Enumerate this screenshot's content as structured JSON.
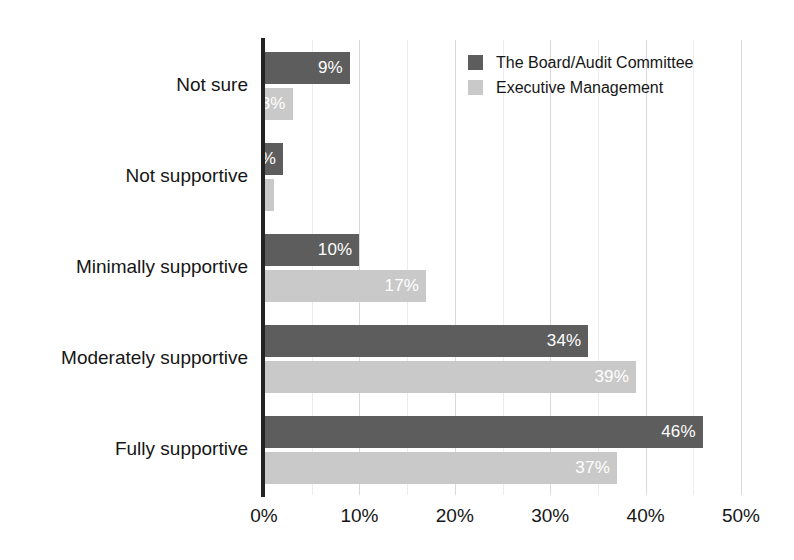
{
  "chart_data": {
    "type": "bar",
    "orientation": "horizontal",
    "title": "",
    "subtitle": "",
    "xlabel": "",
    "ylabel": "",
    "xlim": [
      0,
      50
    ],
    "xticks": [
      "0%",
      "10%",
      "20%",
      "30%",
      "40%",
      "50%"
    ],
    "xtick_values": [
      0,
      10,
      20,
      30,
      40,
      50
    ],
    "grid": true,
    "grid_minor_step": 5,
    "legend_position": "top-right",
    "categories": [
      "Not sure",
      "Not supportive",
      "Minimally supportive",
      "Moderately supportive",
      "Fully supportive"
    ],
    "series": [
      {
        "name": "The Board/Audit Committee",
        "color": "#5d5d5d",
        "values": [
          9,
          2,
          10,
          34,
          46
        ],
        "labels": [
          "9%",
          "2%",
          "10%",
          "34%",
          "46%"
        ]
      },
      {
        "name": "Executive Management",
        "color": "#c9c9c9",
        "values": [
          3,
          1,
          17,
          39,
          37
        ],
        "labels": [
          "3%",
          "",
          "17%",
          "39%",
          "37%"
        ]
      }
    ]
  },
  "legend": {
    "items": [
      {
        "label": "The Board/Audit Committee",
        "swatch": "#5d5d5d"
      },
      {
        "label": "Executive Management",
        "swatch": "#c9c9c9"
      }
    ]
  },
  "axis": {
    "x_ticks": [
      {
        "label": "0%",
        "value": 0
      },
      {
        "label": "10%",
        "value": 10
      },
      {
        "label": "20%",
        "value": 20
      },
      {
        "label": "30%",
        "value": 30
      },
      {
        "label": "40%",
        "value": 40
      },
      {
        "label": "50%",
        "value": 50
      }
    ],
    "y_categories": [
      "Not sure",
      "Not supportive",
      "Minimally supportive",
      "Moderately supportive",
      "Fully supportive"
    ]
  },
  "colors": {
    "series_dark": "#5d5d5d",
    "series_light": "#c9c9c9",
    "axis": "#232323",
    "grid": "#d9d9d9",
    "grid_minor": "#ececec",
    "text": "#161616",
    "bar_label": "#ffffff",
    "background": "#ffffff"
  }
}
